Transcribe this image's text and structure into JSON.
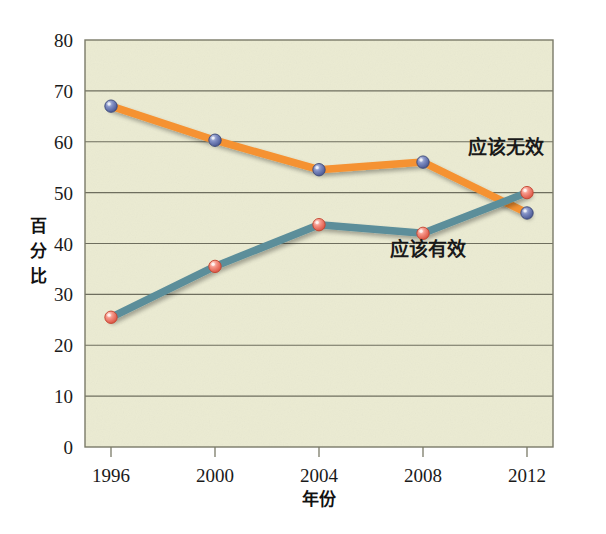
{
  "chart_data": {
    "type": "line",
    "title": "",
    "xlabel": "年份",
    "ylabel": "百分比",
    "categories": [
      "1996",
      "2000",
      "2004",
      "2008",
      "2012"
    ],
    "x": [
      1996,
      2000,
      2004,
      2008,
      2012
    ],
    "xlim": [
      1995,
      2013
    ],
    "ylim": [
      0,
      80
    ],
    "yticks": [
      "0",
      "10",
      "20",
      "30",
      "40",
      "50",
      "60",
      "70",
      "80"
    ],
    "ytick_values": [
      0,
      10,
      20,
      30,
      40,
      50,
      60,
      70,
      80
    ],
    "grid": "horizontal",
    "legend_position": "inline-annotations",
    "series": [
      {
        "name": "应该无效",
        "values": [
          67,
          60.3,
          54.5,
          56,
          46
        ],
        "line_color": "#F59233",
        "marker_color": "#6B7BB5",
        "marker_shape": "circle",
        "label_x": 2011.2,
        "label_y": 57.5
      },
      {
        "name": "应该有效",
        "values": [
          25.5,
          35.5,
          43.7,
          42,
          50
        ],
        "line_color": "#5B8E9A",
        "marker_color": "#F07A6A",
        "marker_shape": "circle",
        "label_x": 2008.2,
        "label_y": 37.5
      }
    ]
  },
  "colors": {
    "page_background": "#FFFFFF",
    "plot_background": "#EBEBD2",
    "plot_border": "#7A7A68",
    "gridline": "#6E6E5E",
    "axis_text": "#1A1A1A",
    "series_orange": "#F59233",
    "series_teal": "#5B8E9A",
    "marker_blue": "#6B7BB5",
    "marker_red": "#F07A6A"
  },
  "geometry": {
    "plot_left": 85,
    "plot_right": 553,
    "plot_top": 40,
    "plot_bottom": 447
  },
  "y_axis_label_chars": [
    "百",
    "分",
    "比"
  ]
}
